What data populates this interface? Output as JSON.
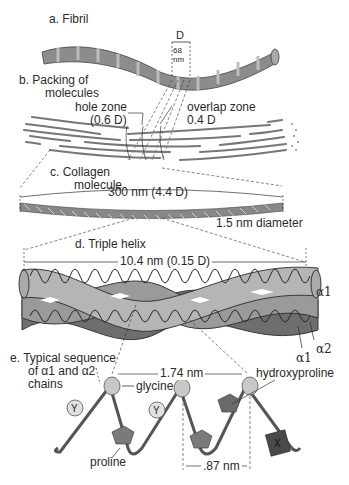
{
  "panels": {
    "a": {
      "title": "a. Fibril",
      "period_label": "D",
      "period_value": "68",
      "period_unit": "nm"
    },
    "b": {
      "title_line1": "b. Packing of",
      "title_line2": "molecules",
      "hole_zone_label": "hole zone",
      "hole_zone_value": "(0.6 D)",
      "overlap_zone_label": "overlap zone",
      "overlap_zone_value": "0.4 D"
    },
    "c": {
      "title_line1": "c. Collagen",
      "title_line2": "molecule",
      "length": "300 nm (4.4 D)",
      "diameter": "1.5 nm diameter"
    },
    "d": {
      "title": "d. Triple helix",
      "pitch": "10.4 nm (0.15 D)",
      "chain_labels": [
        "α1",
        "α2",
        "α1"
      ]
    },
    "e": {
      "title_line1": "e. Typical sequence",
      "title_line2": "of α1 and α2",
      "title_line3": "chains",
      "spacing_large": "1.74 nm",
      "spacing_small": ".87 nm",
      "residues": [
        "glycine",
        "proline",
        "hydroxyproline"
      ],
      "residue_markers": [
        "Y",
        "Y",
        "X"
      ]
    }
  },
  "colors": {
    "fibril": "#8c8c8c",
    "helix_light": "#b5b5b5",
    "helix_mid": "#9a9a9a",
    "helix_dark": "#6e6e6e",
    "line": "#2a2a2a"
  }
}
